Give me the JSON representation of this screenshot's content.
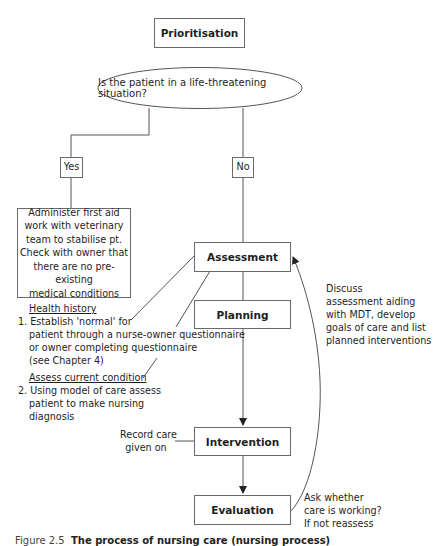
{
  "title_box": {
    "label": "Prioritisation"
  },
  "decision": {
    "question": "Is the patient in a life-threatening situation?"
  },
  "branches": {
    "yes": "Yes",
    "no": "No"
  },
  "yes_action": {
    "lines": [
      "Administer first aid",
      "work with veterinary",
      "team to stabilise pt.",
      "Check with owner that",
      "there are no pre-existing",
      "medical conditions"
    ]
  },
  "process_steps": [
    {
      "label": "Assessment"
    },
    {
      "label": "Planning"
    },
    {
      "label": "Intervention"
    },
    {
      "label": "Evaluation"
    }
  ],
  "assessment_notes": {
    "heading1": "Health history",
    "item1_lines": [
      "1. Establish 'normal' for",
      "patient through a nurse-owner questionnaire",
      "or owner completing questionnaire",
      "(see Chapter 4)"
    ],
    "heading2": "Assess current condition",
    "item2_lines": [
      "2. Using model of care assess",
      "patient to make nursing",
      "diagnosis"
    ]
  },
  "planning_note": {
    "lines": [
      "Discuss",
      "assessment aiding",
      "with MDT, develop",
      "goals of care and list",
      "planned interventions"
    ]
  },
  "intervention_note": {
    "lines": [
      "Record care",
      "given on"
    ]
  },
  "evaluation_note": {
    "lines": [
      "Ask whether",
      "care is working?",
      "If not reassess"
    ]
  },
  "caption": {
    "figure": "Figure 2.5",
    "text": "The process of nursing care (nursing process)"
  },
  "colors": {
    "line": "#555555",
    "border": "#6a6a6a",
    "text": "#1e1e1e"
  }
}
